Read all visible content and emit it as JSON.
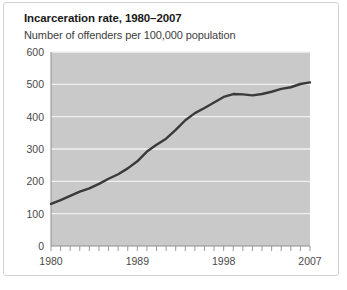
{
  "figure": {
    "title": "Incarceration rate, 1980–2007",
    "subtitle": "Number of offenders per 100,000 population"
  },
  "chart_data": {
    "type": "line",
    "title": "Incarceration rate, 1980–2007",
    "subtitle": "Number of offenders per 100,000 population",
    "xlabel": "",
    "ylabel": "Number of offenders per 100,000 population",
    "xlim": [
      1980,
      2007
    ],
    "ylim": [
      0,
      600
    ],
    "yticks": [
      0,
      100,
      200,
      300,
      400,
      500,
      600
    ],
    "xticks": [
      1980,
      1981,
      1982,
      1983,
      1984,
      1985,
      1986,
      1987,
      1988,
      1989,
      1990,
      1991,
      1992,
      1993,
      1994,
      1995,
      1996,
      1997,
      1998,
      1999,
      2000,
      2001,
      2002,
      2003,
      2004,
      2005,
      2006,
      2007
    ],
    "xtick_labels_shown": [
      "1980",
      "1989",
      "1998",
      "2007"
    ],
    "grid": "horizontal-white",
    "plot_background": "#c9c9c9",
    "line_color": "#3a3a3a",
    "legend": "none",
    "x": [
      1980,
      1981,
      1982,
      1983,
      1984,
      1985,
      1986,
      1987,
      1988,
      1989,
      1990,
      1991,
      1992,
      1993,
      1994,
      1995,
      1996,
      1997,
      1998,
      1999,
      2000,
      2001,
      2002,
      2003,
      2004,
      2005,
      2006,
      2007
    ],
    "values": [
      130,
      142,
      155,
      168,
      178,
      192,
      208,
      222,
      240,
      262,
      292,
      313,
      332,
      359,
      389,
      411,
      427,
      444,
      461,
      470,
      469,
      466,
      470,
      477,
      486,
      491,
      501,
      506
    ]
  },
  "axis": {
    "y_tick_labels": [
      "600",
      "500",
      "400",
      "300",
      "200",
      "100",
      "0"
    ],
    "x_tick_labels": [
      "1980",
      "1989",
      "1998",
      "2007"
    ]
  },
  "colors": {
    "plot_background": "#c9c9c9",
    "gridline": "#f0f0f0",
    "line": "#3a3a3a",
    "frame_border": "#d2d2d2",
    "title_text": "#1a1a1a",
    "subtitle_text": "#3d3d3d",
    "tick_text": "#4a4a4a"
  }
}
